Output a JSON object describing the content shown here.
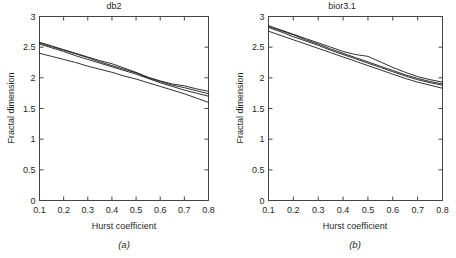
{
  "figure": {
    "panels": [
      {
        "id": "a",
        "title": "db2",
        "caption": "(a)",
        "caption_letter": "a",
        "xlabel": "Hurst coefficient",
        "ylabel": "Fractal dimension"
      },
      {
        "id": "b",
        "title": "bior3.1",
        "caption": "(b)",
        "caption_letter": "b",
        "xlabel": "Hurst coefficient",
        "ylabel": "Fractal dimension"
      }
    ],
    "axes": {
      "xticks": [
        "0.1",
        "0.2",
        "0.3",
        "0.4",
        "0.5",
        "0.6",
        "0.7",
        "0.8"
      ],
      "yticks": [
        "0",
        "0.5",
        "1",
        "1.5",
        "2",
        "2.5",
        "3"
      ]
    },
    "colors": {
      "curve": "#1a1a1a",
      "axis": "#444444",
      "background": "#ffffff",
      "text": "#1f1f1f"
    }
  },
  "chart_data": [
    {
      "type": "line",
      "title": "db2",
      "caption": "(a)",
      "xlabel": "Hurst coefficient",
      "ylabel": "Fractal dimension",
      "xlim": [
        0.1,
        0.8
      ],
      "ylim": [
        0,
        3
      ],
      "xticks": [
        0.1,
        0.2,
        0.3,
        0.4,
        0.5,
        0.6,
        0.7,
        0.8
      ],
      "yticks": [
        0,
        0.5,
        1,
        1.5,
        2,
        2.5,
        3
      ],
      "grid": false,
      "legend": "none",
      "x": [
        0.1,
        0.15,
        0.2,
        0.25,
        0.3,
        0.35,
        0.4,
        0.45,
        0.5,
        0.55,
        0.6,
        0.65,
        0.7,
        0.75,
        0.8
      ],
      "series": [
        {
          "name": "curve-1",
          "values": [
            2.58,
            2.52,
            2.46,
            2.4,
            2.34,
            2.28,
            2.23,
            2.16,
            2.09,
            2.01,
            1.95,
            1.9,
            1.87,
            1.82,
            1.78
          ]
        },
        {
          "name": "curve-2",
          "values": [
            2.57,
            2.51,
            2.45,
            2.39,
            2.33,
            2.26,
            2.2,
            2.14,
            2.08,
            2.0,
            1.94,
            1.88,
            1.84,
            1.79,
            1.74
          ]
        },
        {
          "name": "curve-3",
          "values": [
            2.55,
            2.49,
            2.43,
            2.36,
            2.3,
            2.24,
            2.18,
            2.12,
            2.06,
            1.99,
            1.92,
            1.86,
            1.8,
            1.75,
            1.7
          ]
        },
        {
          "name": "curve-4",
          "values": [
            2.4,
            2.35,
            2.3,
            2.25,
            2.19,
            2.14,
            2.09,
            2.03,
            1.98,
            1.92,
            1.86,
            1.8,
            1.74,
            1.67,
            1.6
          ]
        }
      ]
    },
    {
      "type": "line",
      "title": "bior3.1",
      "caption": "(b)",
      "xlabel": "Hurst coefficient",
      "ylabel": "Fractal dimension",
      "xlim": [
        0.1,
        0.8
      ],
      "ylim": [
        0,
        3
      ],
      "xticks": [
        0.1,
        0.2,
        0.3,
        0.4,
        0.5,
        0.6,
        0.7,
        0.8
      ],
      "yticks": [
        0,
        0.5,
        1,
        1.5,
        2,
        2.5,
        3
      ],
      "grid": false,
      "legend": "none",
      "x": [
        0.1,
        0.15,
        0.2,
        0.25,
        0.3,
        0.35,
        0.4,
        0.45,
        0.5,
        0.55,
        0.6,
        0.65,
        0.7,
        0.75,
        0.8
      ],
      "series": [
        {
          "name": "curve-1",
          "values": [
            2.85,
            2.78,
            2.71,
            2.64,
            2.57,
            2.5,
            2.43,
            2.38,
            2.35,
            2.26,
            2.17,
            2.09,
            2.02,
            1.97,
            1.93
          ]
        },
        {
          "name": "curve-2",
          "values": [
            2.84,
            2.77,
            2.7,
            2.62,
            2.55,
            2.47,
            2.4,
            2.33,
            2.26,
            2.19,
            2.12,
            2.05,
            1.99,
            1.94,
            1.9
          ]
        },
        {
          "name": "curve-3",
          "values": [
            2.82,
            2.75,
            2.67,
            2.6,
            2.53,
            2.45,
            2.38,
            2.31,
            2.24,
            2.17,
            2.1,
            2.03,
            1.97,
            1.92,
            1.88
          ]
        },
        {
          "name": "curve-4",
          "values": [
            2.76,
            2.69,
            2.62,
            2.55,
            2.48,
            2.41,
            2.34,
            2.27,
            2.2,
            2.13,
            2.06,
            1.99,
            1.93,
            1.88,
            1.83
          ]
        }
      ]
    }
  ]
}
